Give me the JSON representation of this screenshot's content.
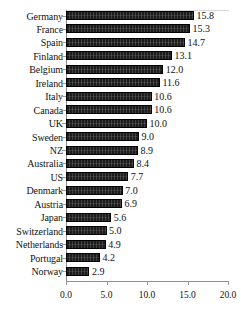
{
  "chart_data": {
    "type": "bar",
    "orientation": "horizontal",
    "title": "",
    "subtitle": "",
    "xlabel": "",
    "ylabel": "",
    "xlim": [
      0.0,
      20.0
    ],
    "xticks": [
      "0.0",
      "5.0",
      "10.0",
      "15.0",
      "20.0"
    ],
    "xtick_values": [
      0.0,
      5.0,
      10.0,
      15.0,
      20.0
    ],
    "grid": false,
    "legend": null,
    "legend_position": "none",
    "bar_color": "#1c1c1c",
    "axis_color": "#8d8d8d",
    "value_label_format": "one-decimal",
    "categories": [
      "Germany",
      "France",
      "Spain",
      "Finland",
      "Belgium",
      "Ireland",
      "Italy",
      "Canada",
      "UK",
      "Sweden",
      "NZ",
      "Australia",
      "US",
      "Denmark",
      "Austria",
      "Japan",
      "Switzerland",
      "Netherlands",
      "Portugal",
      "Norway"
    ],
    "values": [
      15.8,
      15.3,
      14.7,
      13.1,
      12.0,
      11.6,
      10.6,
      10.6,
      10.0,
      9.0,
      8.9,
      8.4,
      7.7,
      7.0,
      6.9,
      5.6,
      5.0,
      4.9,
      4.2,
      2.9
    ],
    "value_labels": [
      "15.8",
      "15.3",
      "14.7",
      "13.1",
      "12.0",
      "11.6",
      "10.6",
      "10.6",
      "10.0",
      "9.0",
      "8.9",
      "8.4",
      "7.7",
      "7.0",
      "6.9",
      "5.6",
      "5.0",
      "4.9",
      "4.2",
      "2.9"
    ]
  }
}
